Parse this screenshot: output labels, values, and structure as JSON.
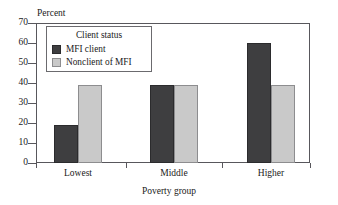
{
  "chart_data": {
    "type": "bar",
    "title": "",
    "categories": [
      "Lowest",
      "Middle",
      "Higher"
    ],
    "series": [
      {
        "name": "MFI client",
        "values": [
          19,
          39,
          60
        ],
        "color": "#3e3e40"
      },
      {
        "name": "Nonclient of MFI",
        "values": [
          39,
          39,
          39
        ],
        "color": "#c9c9c9"
      }
    ],
    "xlabel": "Poverty group",
    "ylabel": "Percent",
    "ylim": [
      0,
      70
    ],
    "ytick_labels": [
      "70",
      "60",
      "50",
      "40",
      "30",
      "20",
      "10",
      "0"
    ],
    "ytick_values": [
      70,
      60,
      50,
      40,
      30,
      20,
      10,
      0
    ],
    "grid": false,
    "legend": {
      "title": "Client status",
      "position": "inside-top-left"
    }
  },
  "axes": {
    "y_unit_label": "Percent",
    "x_axis_title": "Poverty group"
  },
  "legend": {
    "title": "Client status",
    "entries": [
      {
        "label": "MFI client",
        "swatch": "dark"
      },
      {
        "label": "Nonclient of MFI",
        "swatch": "light"
      }
    ]
  },
  "groups": [
    {
      "label": "Lowest"
    },
    {
      "label": "Middle"
    },
    {
      "label": "Higher"
    }
  ]
}
